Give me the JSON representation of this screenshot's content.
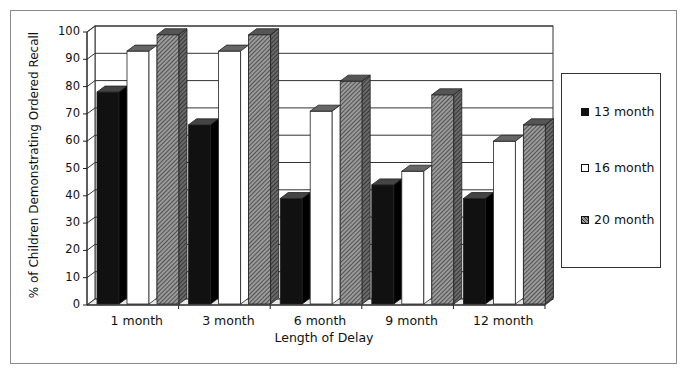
{
  "chart_data": {
    "type": "bar",
    "title": "",
    "xlabel": "Length of Delay",
    "ylabel": "% of Children Demonstrating Ordered Recall",
    "ylim": [
      0,
      100
    ],
    "yticks": [
      "0",
      "10",
      "20",
      "30",
      "40",
      "50",
      "60",
      "70",
      "80",
      "90",
      "100"
    ],
    "grid": true,
    "legend_position": "right",
    "categories": [
      "1 month",
      "3 month",
      "6 month",
      "9 month",
      "12 month"
    ],
    "series": [
      {
        "name": "13 month",
        "color": "#111111",
        "pattern": "solid-black",
        "values": [
          78,
          66,
          39,
          44,
          39
        ]
      },
      {
        "name": "16 month",
        "color": "#ffffff",
        "pattern": "white",
        "values": [
          93,
          93,
          71,
          49,
          60
        ]
      },
      {
        "name": "20 month",
        "color": "#777777",
        "pattern": "diagonal-hatch",
        "values": [
          99,
          99,
          82,
          77,
          66
        ]
      }
    ]
  },
  "legend": {
    "items": [
      {
        "label": "13 month"
      },
      {
        "label": "16 month"
      },
      {
        "label": "20 month"
      }
    ]
  }
}
